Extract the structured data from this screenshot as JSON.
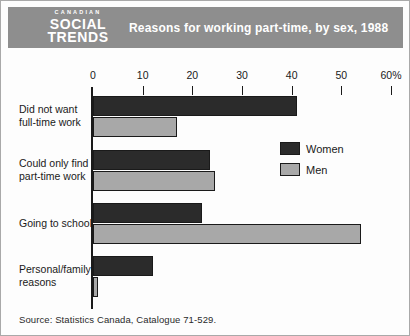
{
  "header": {
    "logo": {
      "line1": "CANADIAN",
      "line2": "SOCIAL",
      "line3": "TRENDS"
    },
    "title": "Reasons for working part-time, by sex, 1988"
  },
  "chart_data": {
    "type": "bar",
    "orientation": "horizontal",
    "title": "Reasons for working part-time, by sex, 1988",
    "categories": [
      "Did not want\nfull-time work",
      "Could only find\npart-time work",
      "Going to school",
      "Personal/family\nreasons"
    ],
    "series": [
      {
        "name": "Women",
        "color": "#2b2b2b",
        "values": [
          41,
          23.5,
          22,
          12
        ]
      },
      {
        "name": "Men",
        "color": "#a8a8a8",
        "values": [
          17,
          24.5,
          54,
          1
        ]
      }
    ],
    "x_axis": {
      "unit": "%",
      "lim": [
        0,
        60
      ],
      "ticks": [
        {
          "label": "0",
          "value": 0
        },
        {
          "label": "10",
          "value": 10
        },
        {
          "label": "20",
          "value": 20
        },
        {
          "label": "30",
          "value": 30
        },
        {
          "label": "40",
          "value": 40
        },
        {
          "label": "50",
          "value": 50
        },
        {
          "label": "60%",
          "value": 60
        }
      ]
    },
    "grid": false,
    "legend_position": "right-middle"
  },
  "footer": {
    "source": "Source: Statistics Canada, Catalogue 71-529."
  },
  "colors": {
    "header_bg": "#8e8e8e",
    "women_bar": "#2b2b2b",
    "men_bar": "#a8a8a8",
    "background": "#fdfdfd",
    "axis": "#1a1a1a"
  }
}
